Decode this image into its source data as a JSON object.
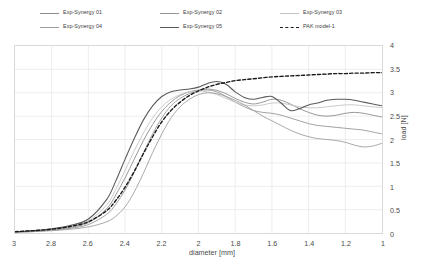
{
  "legend": {
    "items": [
      {
        "label": "Exp-Synergy 01",
        "color": "#8c8c8c",
        "style": "solid",
        "width": 0.9
      },
      {
        "label": "Exp-Synergy 02",
        "color": "#969696",
        "style": "solid",
        "width": 0.9
      },
      {
        "label": "Exp-Synergy 03",
        "color": "#c4c4c4",
        "style": "solid",
        "width": 0.9
      },
      {
        "label": "Exp-Synergy 04",
        "color": "#9e9e9e",
        "style": "solid",
        "width": 0.9
      },
      {
        "label": "Exp-Synergy 05",
        "color": "#5a5a5a",
        "style": "solid",
        "width": 1.1
      },
      {
        "label": "PAK model-1",
        "color": "#1a1a1a",
        "style": "dashed",
        "width": 1.4
      }
    ]
  },
  "chart_data": {
    "type": "line",
    "title": "",
    "xlabel": "diameter [mm]",
    "ylabel": "load [N]",
    "xlim": [
      3,
      1
    ],
    "ylim": [
      0,
      4
    ],
    "x_reversed": true,
    "grid": true,
    "grid_color": "#e8e8e8",
    "frame_color": "#d9d9d9",
    "legend_position": "top",
    "xticks": [
      3,
      2.8,
      2.6,
      2.4,
      2.2,
      2,
      1.8,
      1.6,
      1.4,
      1.2,
      1
    ],
    "xtick_labels": [
      "3",
      "2.8",
      "2.6",
      "2.4",
      "2.2",
      "2",
      "1.8",
      "1.6",
      "1.4",
      "1.2",
      "1"
    ],
    "yticks": [
      0,
      0.5,
      1,
      1.5,
      2,
      2.5,
      3,
      3.5,
      4
    ],
    "ytick_labels": [
      "0",
      "0.5",
      "1",
      "1.5",
      "2",
      "2.5",
      "3",
      "3.5",
      "4"
    ],
    "x": [
      3.0,
      2.9,
      2.8,
      2.7,
      2.6,
      2.5,
      2.45,
      2.4,
      2.35,
      2.3,
      2.25,
      2.2,
      2.15,
      2.1,
      2.05,
      2.0,
      1.95,
      1.9,
      1.85,
      1.8,
      1.75,
      1.7,
      1.65,
      1.6,
      1.55,
      1.5,
      1.45,
      1.4,
      1.35,
      1.3,
      1.25,
      1.2,
      1.15,
      1.1,
      1.05,
      1.0
    ],
    "series": [
      {
        "name": "Exp-Synergy 01",
        "color": "#8c8c8c",
        "style": "solid",
        "width": 0.9,
        "values": [
          0.02,
          0.04,
          0.07,
          0.12,
          0.22,
          0.52,
          0.82,
          1.18,
          1.58,
          1.98,
          2.32,
          2.6,
          2.8,
          2.94,
          3.02,
          3.06,
          3.08,
          3.05,
          2.98,
          2.88,
          2.8,
          2.76,
          2.8,
          2.86,
          2.84,
          2.76,
          2.66,
          2.58,
          2.52,
          2.5,
          2.52,
          2.56,
          2.58,
          2.56,
          2.52,
          2.48
        ]
      },
      {
        "name": "Exp-Synergy 02",
        "color": "#969696",
        "style": "solid",
        "width": 0.9,
        "values": [
          0.02,
          0.03,
          0.06,
          0.1,
          0.18,
          0.4,
          0.62,
          0.92,
          1.3,
          1.72,
          2.12,
          2.46,
          2.72,
          2.88,
          2.98,
          3.04,
          3.06,
          3.02,
          2.92,
          2.8,
          2.7,
          2.62,
          2.58,
          2.56,
          2.52,
          2.46,
          2.4,
          2.34,
          2.3,
          2.28,
          2.26,
          2.24,
          2.22,
          2.2,
          2.16,
          2.12
        ]
      },
      {
        "name": "Exp-Synergy 03",
        "color": "#c4c4c4",
        "style": "solid",
        "width": 0.9,
        "values": [
          0.02,
          0.04,
          0.08,
          0.14,
          0.26,
          0.6,
          0.94,
          1.34,
          1.76,
          2.14,
          2.46,
          2.7,
          2.86,
          2.96,
          3.02,
          3.04,
          3.02,
          2.96,
          2.88,
          2.8,
          2.74,
          2.72,
          2.74,
          2.78,
          2.78,
          2.74,
          2.7,
          2.68,
          2.68,
          2.7,
          2.72,
          2.74,
          2.74,
          2.72,
          2.7,
          2.68
        ]
      },
      {
        "name": "Exp-Synergy 04",
        "color": "#9e9e9e",
        "style": "solid",
        "width": 0.9,
        "values": [
          0.02,
          0.03,
          0.05,
          0.08,
          0.13,
          0.24,
          0.36,
          0.56,
          0.88,
          1.28,
          1.72,
          2.12,
          2.46,
          2.7,
          2.86,
          2.96,
          3.0,
          2.98,
          2.92,
          2.84,
          2.74,
          2.62,
          2.5,
          2.4,
          2.3,
          2.2,
          2.12,
          2.06,
          2.02,
          2.0,
          1.98,
          1.94,
          1.88,
          1.84,
          1.86,
          1.92
        ]
      },
      {
        "name": "Exp-Synergy 05",
        "color": "#5a5a5a",
        "style": "solid",
        "width": 1.1,
        "values": [
          0.02,
          0.05,
          0.09,
          0.16,
          0.3,
          0.72,
          1.12,
          1.58,
          2.02,
          2.42,
          2.72,
          2.92,
          3.02,
          3.06,
          3.08,
          3.12,
          3.2,
          3.24,
          3.18,
          3.02,
          2.9,
          2.86,
          2.9,
          2.92,
          2.78,
          2.62,
          2.66,
          2.74,
          2.78,
          2.84,
          2.86,
          2.86,
          2.84,
          2.8,
          2.76,
          2.72
        ]
      },
      {
        "name": "PAK model-1",
        "color": "#1a1a1a",
        "style": "dashed",
        "width": 1.4,
        "values": [
          0.03,
          0.05,
          0.08,
          0.14,
          0.24,
          0.48,
          0.7,
          0.98,
          1.32,
          1.7,
          2.06,
          2.38,
          2.62,
          2.8,
          2.94,
          3.04,
          3.12,
          3.18,
          3.22,
          3.26,
          3.28,
          3.3,
          3.32,
          3.34,
          3.35,
          3.36,
          3.37,
          3.38,
          3.39,
          3.4,
          3.41,
          3.41,
          3.42,
          3.42,
          3.43,
          3.43
        ]
      }
    ]
  }
}
